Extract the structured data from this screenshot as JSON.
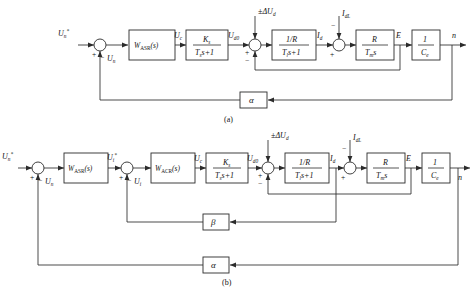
{
  "figure": {
    "title": "",
    "captions": {
      "a": "(a)",
      "b": "(b)"
    }
  },
  "symbols": {
    "ref_speed": "U",
    "ref_speed_sub": "n",
    "ref_star": "*",
    "fb_speed": "U",
    "fb_speed_sub": "n",
    "ctrl_volt": "U",
    "ctrl_volt_sub": "c",
    "conv_volt": "U",
    "conv_volt_sub": "d0",
    "dist_volt": "±ΔU",
    "dist_volt_sub": "d",
    "arm_current": "I",
    "arm_current_sub": "d",
    "load_current": "I",
    "load_current_sub": "dL",
    "emf": "E",
    "speed_out": "n",
    "ref_current": "U",
    "ref_current_sub": "i",
    "fb_current": "U",
    "fb_current_sub": "i",
    "plus": "+",
    "minus": "−"
  },
  "blocks": {
    "asr": {
      "name": "W",
      "sub": "ASR",
      "arg": "(s)"
    },
    "acr": {
      "name": "W",
      "sub": "ACR",
      "arg": "(s)"
    },
    "converter": {
      "num": "K",
      "num_sub": "s",
      "den_t": "T",
      "den_sub": "s",
      "den_tail": "s+1"
    },
    "armature": {
      "num": "1/R",
      "den_t": "T",
      "den_sub": "l",
      "den_tail": "s+1"
    },
    "mechanical": {
      "num": "R",
      "den_t": "T",
      "den_sub": "m",
      "den_tail": "s"
    },
    "emf_coef": {
      "num": "1",
      "den": "C",
      "den_sub": "e"
    },
    "speed_fb": "α",
    "current_fb": "β"
  },
  "colors": {
    "line": "#2b2b2b",
    "text": "#141414",
    "background": "#ffffff"
  }
}
